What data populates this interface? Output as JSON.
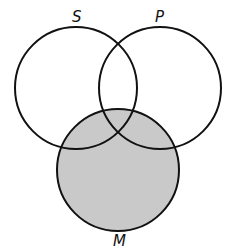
{
  "diagram": {
    "type": "venn",
    "labels": {
      "s": "S",
      "p": "P",
      "m": "M"
    },
    "circles": [
      {
        "name": "S",
        "cx": 76,
        "cy": 88,
        "r": 61
      },
      {
        "name": "P",
        "cx": 160,
        "cy": 88,
        "r": 61
      },
      {
        "name": "M",
        "cx": 118,
        "cy": 170,
        "r": 61
      }
    ],
    "shaded_region": "M",
    "colors": {
      "shade": "#c9c9c9",
      "stroke": "#111111"
    }
  }
}
